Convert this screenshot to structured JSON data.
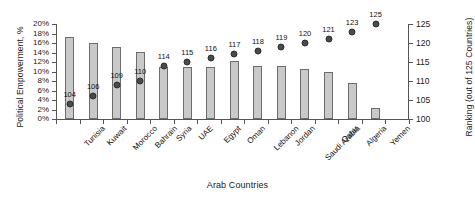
{
  "chart_data": {
    "type": "bar",
    "title": "",
    "xlabel": "Arab Countries",
    "ylabel": "Political Empowerment, %",
    "y2label": "Ranking (out of 125 Countries)",
    "grid": false,
    "legend": "none",
    "ylim": [
      0,
      20
    ],
    "y2lim": [
      100,
      125
    ],
    "ytick_labels": [
      "20%",
      "18%",
      "16%",
      "14%",
      "12%",
      "10%",
      "8%",
      "6%",
      "4%",
      "2%",
      "0%"
    ],
    "ytick_values": [
      20,
      18,
      16,
      14,
      12,
      10,
      8,
      6,
      4,
      2,
      0
    ],
    "y2tick_labels": [
      "125",
      "120",
      "115",
      "110",
      "105",
      "100"
    ],
    "y2tick_values": [
      125,
      120,
      115,
      110,
      105,
      100
    ],
    "categories": [
      "Tunisia",
      "Kuwait",
      "Morocco",
      "Bahrain",
      "Syria",
      "UAE",
      "Egypt",
      "Oman",
      "Lebanon",
      "Jordan",
      "Saudi Arabia",
      "Qatar",
      "Algeria",
      "Yemen"
    ],
    "series": [
      {
        "name": "Political Empowerment, %",
        "axis": "left",
        "type": "bar",
        "values": [
          17.2,
          16.1,
          15.2,
          14.1,
          11.0,
          10.9,
          10.9,
          12.2,
          11.1,
          11.1,
          10.6,
          10.0,
          7.6,
          2.4
        ]
      },
      {
        "name": "Ranking (out of 125 Countries)",
        "axis": "right",
        "type": "scatter",
        "values": [
          104,
          106,
          109,
          110,
          114,
          115,
          116,
          117,
          118,
          119,
          120,
          121,
          123,
          125
        ],
        "point_labels": [
          "104",
          "106",
          "109",
          "110",
          "114",
          "115",
          "116",
          "117",
          "118",
          "119",
          "120",
          "121",
          "123",
          "125"
        ]
      }
    ],
    "colors": {
      "bar_fill": "#c9c9c9",
      "bar_border": "#6d6d6d",
      "marker_fill": "#4a4a4a",
      "marker_border": "#2e2e2e",
      "axis": "#555555",
      "text": "#111111",
      "background": "#ffffff"
    }
  }
}
